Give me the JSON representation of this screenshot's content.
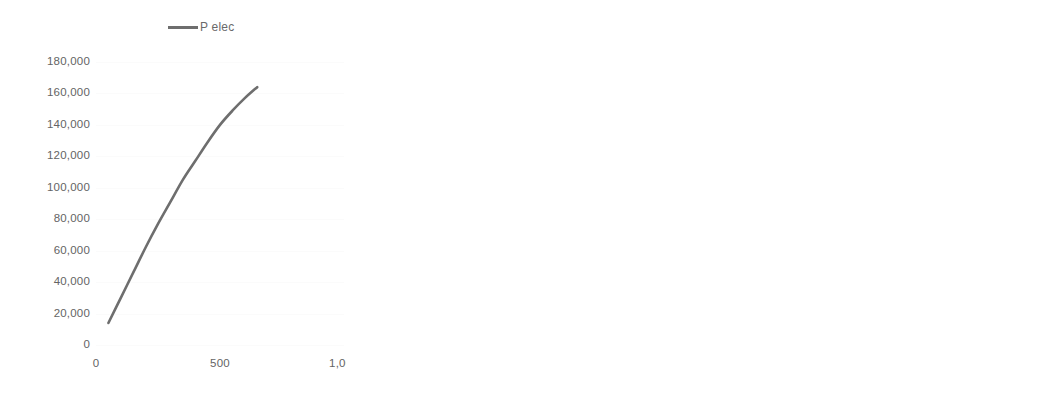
{
  "figure": {
    "background": "#ffffff",
    "line_color": "#6e6e6e",
    "text_color": "#646464",
    "panel_count": 3
  },
  "chart_data": [
    {
      "type": "line",
      "title": "",
      "subtitle": "",
      "xlabel": "",
      "ylabel": "",
      "legend": [
        "P elec"
      ],
      "legend_position": "top-center",
      "grid": true,
      "xlim": [
        0,
        1000
      ],
      "ylim": [
        0,
        180000
      ],
      "xticks": [
        0,
        500,
        1000
      ],
      "xticklabels": [
        "0",
        "500",
        "1,000"
      ],
      "yticks": [
        0,
        20000,
        40000,
        60000,
        80000,
        100000,
        120000,
        140000,
        160000,
        180000
      ],
      "yticklabels": [
        "0",
        "20,000",
        "40,000",
        "60,000",
        "80,000",
        "100,000",
        "120,000",
        "140,000",
        "160,000",
        "180,000"
      ],
      "series": [
        {
          "name": "P elec",
          "x": [
            50,
            100,
            150,
            200,
            250,
            300,
            350,
            400,
            450,
            500,
            550,
            600,
            650
          ],
          "y": [
            14000,
            30000,
            46000,
            62000,
            77000,
            91000,
            105000,
            117000,
            129000,
            140000,
            149000,
            157000,
            164000
          ]
        }
      ]
    },
    {
      "type": "line",
      "title": "",
      "subtitle": "",
      "xlabel": "",
      "ylabel": "",
      "legend": [
        "epsi"
      ],
      "legend_position": "top-center",
      "grid": true,
      "xlim": [
        0,
        800
      ],
      "ylim": [
        0.3,
        0.55
      ],
      "xticks": [
        0,
        200,
        400,
        600,
        800
      ],
      "xticklabels": [
        "0",
        "200",
        "400",
        "600",
        "800"
      ],
      "yticks": [
        0.3,
        0.35,
        0.4,
        0.45,
        0.5,
        0.55
      ],
      "yticklabels": [
        "0.3",
        "0.35",
        "0.4",
        "0.45",
        "0.5",
        "0.55"
      ],
      "series": [
        {
          "name": "epsi",
          "x": [
            50,
            100,
            150,
            200,
            250,
            300,
            350,
            400,
            450,
            500,
            550,
            600,
            650
          ],
          "y": [
            0.494,
            0.482,
            0.474,
            0.467,
            0.46,
            0.453,
            0.446,
            0.438,
            0.43,
            0.422,
            0.413,
            0.404,
            0.394
          ]
        }
      ]
    },
    {
      "type": "line",
      "title": "",
      "subtitle": "",
      "xlabel": "",
      "ylabel": "",
      "legend": [
        "eta_exer"
      ],
      "legend_position": "top-center",
      "grid": true,
      "xlim": [
        0,
        800
      ],
      "ylim": [
        0.6,
        0.95
      ],
      "xticks": [
        0,
        200,
        400,
        600,
        800
      ],
      "xticklabels": [
        "0",
        "200",
        "400",
        "600",
        "800"
      ],
      "yticks": [
        0.6,
        0.65,
        0.7,
        0.75,
        0.8,
        0.85,
        0.9,
        0.95
      ],
      "yticklabels": [
        "0.6",
        "0.65",
        "0.7",
        "0.75",
        "0.8",
        "0.85",
        "0.9",
        "0.95"
      ],
      "series": [
        {
          "name": "eta_exer",
          "x": [
            50,
            100,
            150,
            200,
            250,
            300,
            350,
            400,
            450,
            500,
            550,
            600,
            650
          ],
          "y": [
            0.916,
            0.896,
            0.874,
            0.851,
            0.828,
            0.806,
            0.785,
            0.765,
            0.746,
            0.729,
            0.713,
            0.699,
            0.686
          ]
        }
      ]
    }
  ]
}
